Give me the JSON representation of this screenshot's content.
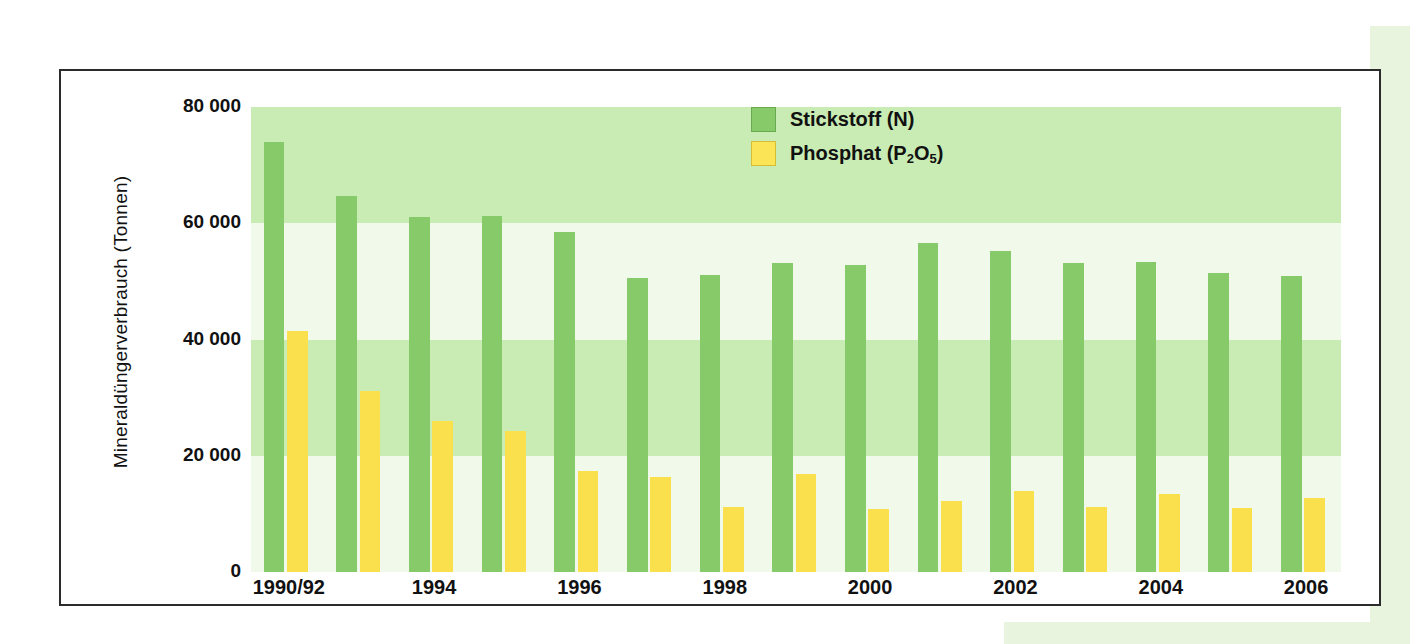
{
  "chart_data": {
    "type": "bar",
    "title": "",
    "xlabel": "",
    "ylabel": "Mineraldüngerverbrauch (Tonnen)",
    "ylim": [
      0,
      80000
    ],
    "yticks": [
      "0",
      "20 000",
      "40 000",
      "60 000",
      "80 000"
    ],
    "ytick_values": [
      0,
      20000,
      40000,
      60000,
      80000
    ],
    "grid": "horizontal alternating shaded bands every 20000",
    "legend_position": "top-center-right",
    "categories": [
      "1990/92",
      "1993",
      "1994",
      "1995",
      "1996",
      "1997",
      "1998",
      "1999",
      "2000",
      "2001",
      "2002",
      "2003",
      "2004",
      "2005",
      "2006"
    ],
    "xtick_labels": [
      "1990/92",
      "1994",
      "1996",
      "1998",
      "2000",
      "2002",
      "2004",
      "2006"
    ],
    "xtick_category_index": [
      0,
      2,
      4,
      6,
      8,
      10,
      12,
      14
    ],
    "series": [
      {
        "name": "Stickstoff (N)",
        "color": "#86ca6a",
        "values": [
          73900,
          64700,
          61100,
          61200,
          58500,
          50500,
          51100,
          53200,
          52900,
          56600,
          55300,
          53200,
          53300,
          51400,
          50900
        ]
      },
      {
        "name": "Phosphat (P2O5)",
        "color": "#fbe04e",
        "values": [
          41400,
          31200,
          25900,
          24300,
          17400,
          16400,
          11100,
          16900,
          10800,
          12200,
          14000,
          11100,
          13500,
          11000,
          12800
        ]
      }
    ]
  },
  "legend": {
    "items": [
      {
        "label_html": "Stickstoff (N)",
        "color": "#86ca6a"
      },
      {
        "label_html": "Phosphat (P2O5)",
        "color": "#fbe04e"
      }
    ]
  },
  "colors": {
    "bar_nitrogen": "#86ca6a",
    "bar_phosphate": "#fbe04e",
    "plot_background": "#f1faea",
    "band": "#c9ebb4",
    "panel": "#e8f4dd",
    "frame": "#2b2b2b"
  }
}
